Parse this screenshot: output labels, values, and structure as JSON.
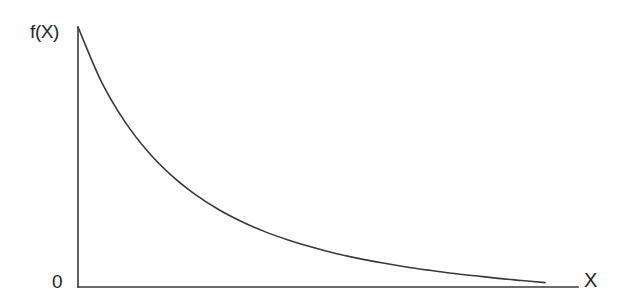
{
  "figure": {
    "background_color": "#ffffff",
    "line_color": "#3a3a3a",
    "text_color": "#262626",
    "width": 622,
    "height": 306
  },
  "labels": {
    "y_axis": "f(X)",
    "origin": "0",
    "x_axis": "X"
  },
  "chart_data": {
    "type": "line",
    "title": "",
    "xlabel": "X",
    "ylabel": "f(X)",
    "subtitle": "",
    "grid": false,
    "legend": null,
    "annotations": [
      {
        "text": "f(X)",
        "position": "y-axis-top",
        "x": 0,
        "y": 1.0
      },
      {
        "text": "0",
        "position": "origin",
        "x": 0,
        "y": 0
      },
      {
        "text": "X",
        "position": "x-axis-right",
        "x": 1.0,
        "y": 0
      }
    ],
    "xlim": [
      0,
      1
    ],
    "ylim": [
      0,
      1
    ],
    "xticks": [],
    "yticks": [],
    "xticklabels": [],
    "yticklabels": [
      "0"
    ],
    "series": [
      {
        "name": "f(X)",
        "color": "#3a3a3a",
        "x": [
          0.0,
          0.05,
          0.1,
          0.15,
          0.2,
          0.25,
          0.3,
          0.35,
          0.4,
          0.45,
          0.5,
          0.55,
          0.6,
          0.65,
          0.7,
          0.75,
          0.8,
          0.85,
          0.9,
          0.95,
          1.0
        ],
        "y": [
          1.0,
          0.79,
          0.637,
          0.52,
          0.429,
          0.357,
          0.299,
          0.252,
          0.213,
          0.181,
          0.154,
          0.13,
          0.11,
          0.093,
          0.078,
          0.065,
          0.053,
          0.043,
          0.033,
          0.025,
          0.017
        ]
      }
    ]
  },
  "axes": {
    "y_axis": {
      "x": 78,
      "y_top": 27,
      "y_bottom": 287
    },
    "x_axis": {
      "y": 287,
      "x_left": 78,
      "x_right": 578
    }
  }
}
